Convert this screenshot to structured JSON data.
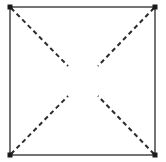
{
  "figure": {
    "title": "Square frame with dashed diagonals",
    "background_color": "#ffffff",
    "canvas": {
      "width": 166,
      "height": 162
    },
    "frame": {
      "name": "square-outline",
      "shape": "square",
      "stroke_color": "#3a3a3a",
      "stroke_width": 1.4,
      "fill": "none",
      "left": 10,
      "top": 7,
      "right": 155,
      "bottom": 155,
      "width": 145,
      "height": 148
    },
    "corner_marks": {
      "name": "corner-thickening",
      "color": "#1a1a1a",
      "size": 5,
      "points": [
        {
          "label": "top-left",
          "x": 10,
          "y": 7
        },
        {
          "label": "top-right",
          "x": 155,
          "y": 7
        },
        {
          "label": "bottom-left",
          "x": 10,
          "y": 155
        },
        {
          "label": "bottom-right",
          "x": 155,
          "y": 155
        }
      ]
    },
    "diagonals": {
      "style": "dashed",
      "stroke_color": "#2b2b2b",
      "stroke_width": 2.0,
      "dash_length": 4.5,
      "gap_length": 3.5,
      "center_gap_radius": 22,
      "segments": [
        {
          "name": "diagonal-top-left-to-center",
          "x1": 11,
          "y1": 8,
          "x2": 68,
          "y2": 66
        },
        {
          "name": "diagonal-top-right-to-center",
          "x1": 154,
          "y1": 8,
          "x2": 98,
          "y2": 66
        },
        {
          "name": "diagonal-bottom-left-to-center",
          "x1": 11,
          "y1": 154,
          "x2": 68,
          "y2": 96
        },
        {
          "name": "diagonal-bottom-right-to-center",
          "x1": 154,
          "y1": 154,
          "x2": 98,
          "y2": 96
        }
      ]
    },
    "center_void": {
      "name": "center-blank-area",
      "cx": 83,
      "cy": 81,
      "width": 30,
      "height": 30,
      "fill": "#ffffff"
    }
  }
}
